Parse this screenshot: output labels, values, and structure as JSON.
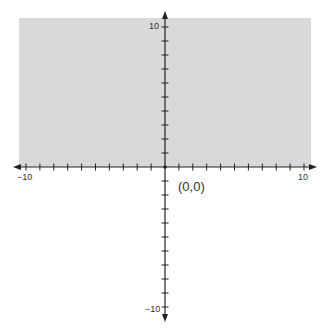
{
  "diagram": {
    "shade_color": "#d9d9d9",
    "axis_color": "#222222",
    "labels": {
      "x_min": "−10",
      "x_max": "10",
      "y_max": "10",
      "y_min": "−10",
      "origin": "(0,0)"
    }
  },
  "chart_data": {
    "type": "heatmap",
    "title": "",
    "xlabel": "",
    "ylabel": "",
    "xlim": [
      -10,
      10
    ],
    "ylim": [
      -10,
      10
    ],
    "tick_step": 1,
    "labeled_ticks": {
      "x": [
        -10,
        10
      ],
      "y": [
        -10,
        10
      ]
    },
    "shaded_region": "upper half-plane (y > 0)",
    "annotations": [
      "(0,0)"
    ],
    "grid": false
  }
}
